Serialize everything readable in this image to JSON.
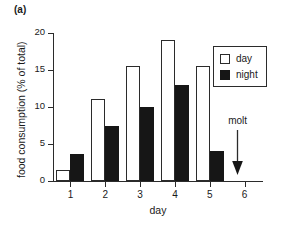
{
  "panel": {
    "label": "(a)"
  },
  "legend": {
    "position": "upper-right",
    "entries": [
      {
        "label": "day",
        "swatch": "open-square"
      },
      {
        "label": "night",
        "swatch": "filled-square"
      }
    ]
  },
  "annotation": {
    "label": "molt",
    "icon": "down-arrow-icon",
    "x_value": 5.8
  },
  "chart_data": {
    "type": "bar",
    "title": "",
    "subtitle": "",
    "xlabel": "day",
    "ylabel": "food consumption (% of total)",
    "categories": [
      "1",
      "2",
      "3",
      "4",
      "5",
      "6"
    ],
    "x": [
      1,
      2,
      3,
      4,
      5,
      6
    ],
    "series": [
      {
        "name": "day",
        "color": "#ffffff",
        "edge_color": "#2b2b2b",
        "values": [
          1.5,
          11.1,
          15.5,
          19.0,
          15.5,
          null
        ]
      },
      {
        "name": "night",
        "color": "#161616",
        "edge_color": "#161616",
        "values": [
          3.7,
          7.5,
          10.0,
          13.0,
          4.0,
          null
        ]
      }
    ],
    "ylim": [
      0,
      20
    ],
    "yticks": [
      0,
      5,
      10,
      15,
      20
    ],
    "ytick_labels": [
      "0",
      "5",
      "10",
      "15",
      "20"
    ],
    "xticks": [
      1,
      2,
      3,
      4,
      5,
      6
    ],
    "xtick_labels": [
      "1",
      "2",
      "3",
      "4",
      "5",
      "6"
    ],
    "xlim": [
      0.5,
      6.5
    ],
    "grid": false,
    "legend_position": "upper right",
    "annotations": [
      {
        "text": "molt",
        "x": 5.8,
        "marker": "down-arrow"
      }
    ]
  }
}
